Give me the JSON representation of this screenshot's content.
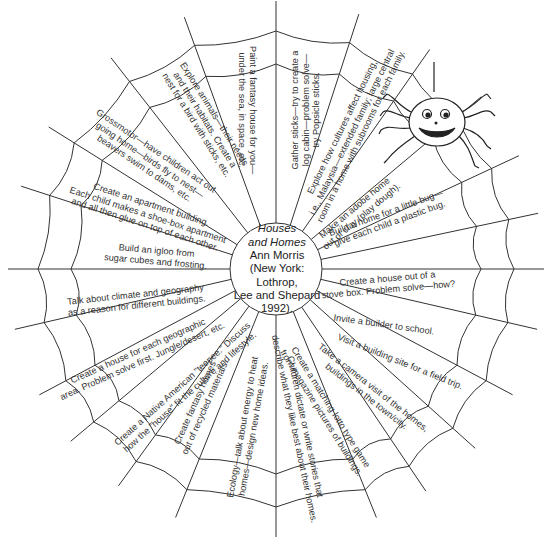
{
  "center": {
    "title_line1": "Houses",
    "title_line2": "and Homes",
    "author": "Ann Morris",
    "publisher_line1": "(New York: Lothrop,",
    "publisher_line2": "Lee and Shepard",
    "publisher_line3": "1992)."
  },
  "segments": [
    {
      "id": "fantasy-house",
      "text": "Paint a fantasy house for you—\nunder the sea, in space, etc."
    },
    {
      "id": "gather-sticks",
      "text": "Gather sticks—try to create a\nlog cabin—problem solve—\ntry Popsicle sticks."
    },
    {
      "id": "cultures",
      "text": "Explore how cultures affect housing,\ni.e., Malaysia—extended family; large central\nroom in a home with subrooms for each family."
    },
    {
      "id": "adobe",
      "text": "Make an adobe home\nout of clay (play dough)."
    },
    {
      "id": "bug-home",
      "text": "Build a home for a little bug—\ngive each child a plastic bug."
    },
    {
      "id": "stove-box",
      "text": "Create a house out of a\nstove box. Problem solve—how?"
    },
    {
      "id": "builder",
      "text": "Invite a builder to school."
    },
    {
      "id": "field-trip",
      "text": "Visit a building site for a field trip."
    },
    {
      "id": "camera-visit",
      "text": "Take a camera visit of the homes,\nbuildings in the town/city."
    },
    {
      "id": "lotto-game",
      "text": "Create a matching lotto type game\nfrom magazine pictures of buildings."
    },
    {
      "id": "stories",
      "text": "Children dictate or write stories that\ndescribe what they like best about their homes."
    },
    {
      "id": "ecology",
      "text": "Ecology—talk about energy to heat\nhomes—design new home ideas."
    },
    {
      "id": "recycled",
      "text": "Create fantasy homes\nout of recycled materials."
    },
    {
      "id": "teepee",
      "text": "Create a Native American \"teepee.\" Discuss\nhow the \"house\" fit the culture and lifestyle."
    },
    {
      "id": "geographic",
      "text": "Create a house for each geographic\narea. Problem solve first. Jungle/desert, etc."
    },
    {
      "id": "climate",
      "text": "Talk about climate and geography\nas a reason for different buildings."
    },
    {
      "id": "igloo",
      "text": "Build an igloo from\nsugar cubes and frosting."
    },
    {
      "id": "apartment",
      "text": "Create an apartment building.\nEach child makes a shoe-box apartment\nand all then glue on top of each other."
    },
    {
      "id": "grossmotor",
      "text": "Grossmotor—have children act out\ngoing home—birds fly to nest—\nbeavers swim to dams, etc."
    },
    {
      "id": "animals",
      "text": "Explore animals—their needs\nand their habitats. Create a\nnest for a bird with sticks, etc."
    }
  ],
  "colors": {
    "line": "#333333",
    "text": "#333333",
    "background": "#ffffff"
  },
  "decoration": {
    "spider_icon": "smiling-spider"
  }
}
